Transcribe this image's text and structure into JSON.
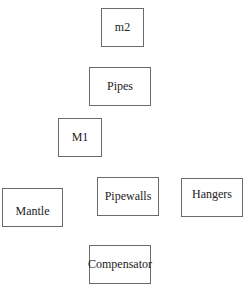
{
  "diagram": {
    "nodes": [
      {
        "id": "m2",
        "label": "m2",
        "x": 101,
        "y": 8,
        "w": 43,
        "h": 39
      },
      {
        "id": "pipes",
        "label": "Pipes",
        "x": 89,
        "y": 67,
        "w": 62,
        "h": 39
      },
      {
        "id": "m1",
        "label": "M1",
        "x": 58,
        "y": 118,
        "w": 44,
        "h": 39
      },
      {
        "id": "mantle",
        "label": "Mantle",
        "x": 2,
        "y": 188,
        "w": 61,
        "h": 39
      },
      {
        "id": "pipewalls",
        "label": "Pipewalls",
        "x": 97,
        "y": 177,
        "w": 62,
        "h": 39
      },
      {
        "id": "hangers",
        "label": "Hangers",
        "x": 181,
        "y": 178,
        "w": 62,
        "h": 39
      },
      {
        "id": "compensator",
        "label": "Compensator",
        "x": 89,
        "y": 245,
        "w": 62,
        "h": 39
      }
    ],
    "border_color": "#6b6b6b",
    "text_color": "#222222"
  }
}
